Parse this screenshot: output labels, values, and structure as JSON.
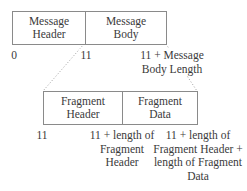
{
  "diagram": {
    "message": {
      "cells": [
        {
          "label": "Message\nHeader"
        },
        {
          "label": "Message\nBody"
        }
      ],
      "offsets": [
        {
          "label": "0"
        },
        {
          "label": "11"
        },
        {
          "label": "11 + Message\nBody Length"
        }
      ]
    },
    "fragment": {
      "cells": [
        {
          "label": "Fragment\nHeader"
        },
        {
          "label": "Fragment\nData"
        }
      ],
      "offsets": [
        {
          "label": "11"
        },
        {
          "label": "11 + length of\nFragment\nHeader"
        },
        {
          "label": "11 + length of\nFragment Header +\nlength of Fragment\nData"
        }
      ]
    },
    "colors": {
      "border": "#8a8a8a",
      "text": "#3a3a3a",
      "dotted": "#a0a0a0"
    }
  }
}
